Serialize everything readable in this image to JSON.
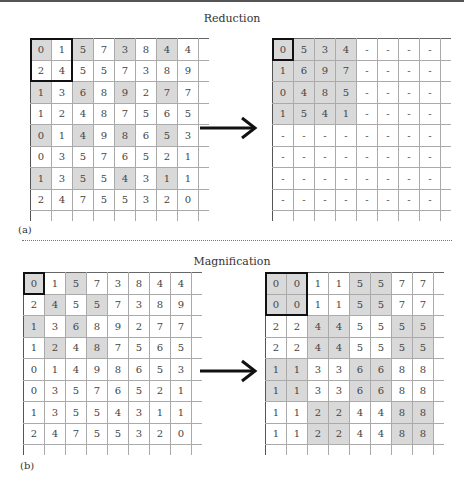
{
  "panels": {
    "reduction": {
      "title": "Reduction",
      "label": "(a)",
      "input": {
        "rows": [
          [
            "0",
            "1",
            "5",
            "7",
            "3",
            "8",
            "4",
            "4"
          ],
          [
            "2",
            "4",
            "5",
            "5",
            "7",
            "3",
            "8",
            "9"
          ],
          [
            "1",
            "3",
            "6",
            "8",
            "9",
            "2",
            "7",
            "7"
          ],
          [
            "1",
            "2",
            "4",
            "8",
            "7",
            "5",
            "6",
            "5"
          ],
          [
            "0",
            "1",
            "4",
            "9",
            "8",
            "6",
            "5",
            "3"
          ],
          [
            "0",
            "3",
            "5",
            "7",
            "6",
            "5",
            "2",
            "1"
          ],
          [
            "1",
            "3",
            "5",
            "5",
            "4",
            "3",
            "1",
            "1"
          ],
          [
            "2",
            "4",
            "7",
            "5",
            "5",
            "3",
            "2",
            "0"
          ]
        ],
        "shaded": [
          [
            0,
            0
          ],
          [
            0,
            2
          ],
          [
            0,
            4
          ],
          [
            0,
            6
          ],
          [
            2,
            0
          ],
          [
            2,
            2
          ],
          [
            2,
            4
          ],
          [
            2,
            6
          ],
          [
            4,
            0
          ],
          [
            4,
            2
          ],
          [
            4,
            4
          ],
          [
            4,
            6
          ],
          [
            6,
            0
          ],
          [
            6,
            2
          ],
          [
            6,
            4
          ],
          [
            6,
            6
          ]
        ],
        "highlight": {
          "row": 0,
          "col": 0,
          "rows": 2,
          "cols": 2
        }
      },
      "output": {
        "rows": [
          [
            "0",
            "5",
            "3",
            "4",
            "-",
            "-",
            "-",
            "-"
          ],
          [
            "1",
            "6",
            "9",
            "7",
            "-",
            "-",
            "-",
            "-"
          ],
          [
            "0",
            "4",
            "8",
            "5",
            "-",
            "-",
            "-",
            "-"
          ],
          [
            "1",
            "5",
            "4",
            "1",
            "-",
            "-",
            "-",
            "-"
          ],
          [
            "-",
            "-",
            "-",
            "-",
            "-",
            "-",
            "-",
            "-"
          ],
          [
            "-",
            "-",
            "-",
            "-",
            "-",
            "-",
            "-",
            "-"
          ],
          [
            "-",
            "-",
            "-",
            "-",
            "-",
            "-",
            "-",
            "-"
          ],
          [
            "-",
            "-",
            "-",
            "-",
            "-",
            "-",
            "-",
            "-"
          ]
        ],
        "shaded": [
          [
            0,
            0
          ],
          [
            0,
            1
          ],
          [
            0,
            2
          ],
          [
            0,
            3
          ],
          [
            1,
            0
          ],
          [
            1,
            1
          ],
          [
            1,
            2
          ],
          [
            1,
            3
          ],
          [
            2,
            0
          ],
          [
            2,
            1
          ],
          [
            2,
            2
          ],
          [
            2,
            3
          ],
          [
            3,
            0
          ],
          [
            3,
            1
          ],
          [
            3,
            2
          ],
          [
            3,
            3
          ]
        ],
        "highlight": {
          "row": 0,
          "col": 0,
          "rows": 1,
          "cols": 1
        }
      }
    },
    "magnification": {
      "title": "Magnification",
      "label": "(b)",
      "input": {
        "rows": [
          [
            "0",
            "1",
            "5",
            "7",
            "3",
            "8",
            "4",
            "4"
          ],
          [
            "2",
            "4",
            "5",
            "5",
            "7",
            "3",
            "8",
            "9"
          ],
          [
            "1",
            "3",
            "6",
            "8",
            "9",
            "2",
            "7",
            "7"
          ],
          [
            "1",
            "2",
            "4",
            "8",
            "7",
            "5",
            "6",
            "5"
          ],
          [
            "0",
            "1",
            "4",
            "9",
            "8",
            "6",
            "5",
            "3"
          ],
          [
            "0",
            "3",
            "5",
            "7",
            "6",
            "5",
            "2",
            "1"
          ],
          [
            "1",
            "3",
            "5",
            "5",
            "4",
            "3",
            "1",
            "1"
          ],
          [
            "2",
            "4",
            "7",
            "5",
            "5",
            "3",
            "2",
            "0"
          ]
        ],
        "shaded": [
          [
            0,
            0
          ],
          [
            0,
            2
          ],
          [
            1,
            1
          ],
          [
            1,
            3
          ],
          [
            2,
            0
          ],
          [
            2,
            2
          ],
          [
            3,
            1
          ],
          [
            3,
            3
          ]
        ],
        "highlight": {
          "row": 0,
          "col": 0,
          "rows": 1,
          "cols": 1
        }
      },
      "output": {
        "rows": [
          [
            "0",
            "0",
            "1",
            "1",
            "5",
            "5",
            "7",
            "7"
          ],
          [
            "0",
            "0",
            "1",
            "1",
            "5",
            "5",
            "7",
            "7"
          ],
          [
            "2",
            "2",
            "4",
            "4",
            "5",
            "5",
            "5",
            "5"
          ],
          [
            "2",
            "2",
            "4",
            "4",
            "5",
            "5",
            "5",
            "5"
          ],
          [
            "1",
            "1",
            "3",
            "3",
            "6",
            "6",
            "8",
            "8"
          ],
          [
            "1",
            "1",
            "3",
            "3",
            "6",
            "6",
            "8",
            "8"
          ],
          [
            "1",
            "1",
            "2",
            "2",
            "4",
            "4",
            "8",
            "8"
          ],
          [
            "1",
            "1",
            "2",
            "2",
            "4",
            "4",
            "8",
            "8"
          ]
        ],
        "shaded": [
          [
            0,
            0
          ],
          [
            0,
            1
          ],
          [
            1,
            0
          ],
          [
            1,
            1
          ],
          [
            0,
            4
          ],
          [
            0,
            5
          ],
          [
            1,
            4
          ],
          [
            1,
            5
          ],
          [
            2,
            2
          ],
          [
            2,
            3
          ],
          [
            3,
            2
          ],
          [
            3,
            3
          ],
          [
            2,
            6
          ],
          [
            2,
            7
          ],
          [
            3,
            6
          ],
          [
            3,
            7
          ],
          [
            4,
            0
          ],
          [
            4,
            1
          ],
          [
            5,
            0
          ],
          [
            5,
            1
          ],
          [
            4,
            4
          ],
          [
            4,
            5
          ],
          [
            5,
            4
          ],
          [
            5,
            5
          ],
          [
            6,
            2
          ],
          [
            6,
            3
          ],
          [
            7,
            2
          ],
          [
            7,
            3
          ],
          [
            6,
            6
          ],
          [
            6,
            7
          ],
          [
            7,
            6
          ],
          [
            7,
            7
          ]
        ],
        "highlight": {
          "row": 0,
          "col": 0,
          "rows": 2,
          "cols": 2
        }
      }
    }
  },
  "arrow_icon": "right-arrow",
  "colors": {
    "shade": "#d9d9d9",
    "grid": "#aaaaaa",
    "highlight": "#111111"
  }
}
